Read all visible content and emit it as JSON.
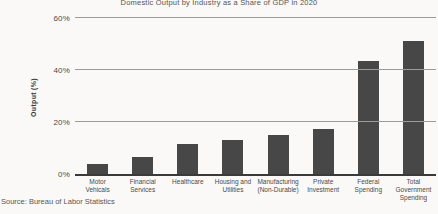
{
  "chart_data": {
    "type": "bar",
    "title": "Domestic Output by Industry as a Share of GDP in 2020",
    "xlabel": "",
    "ylabel": "Output (%)",
    "source": "Source: Bureau of Labor Statistics",
    "categories": [
      "Motor\nVehicals",
      "Financial\nServices",
      "Healthcare",
      "Housing and\nUtilities",
      "Manufacturing\n(Non-Durable)",
      "Private\nInvestment",
      "Federal\nSpending",
      "Total\nGovernment\nSpending"
    ],
    "values": [
      4,
      6.5,
      11.5,
      13,
      15,
      17.5,
      43.5,
      51
    ],
    "y_ticks": [
      {
        "label": "60%",
        "value": 60
      },
      {
        "label": "40%",
        "value": 40
      },
      {
        "label": "20%",
        "value": 20
      },
      {
        "label": "0%",
        "value": 0
      }
    ],
    "ylim": [
      0,
      60
    ],
    "grid": true,
    "legend": false,
    "bar_color": "#474747",
    "gridline_color": "#9b9b99",
    "axis_color": "#3a3a3a",
    "background_color": "#faf9f7"
  }
}
